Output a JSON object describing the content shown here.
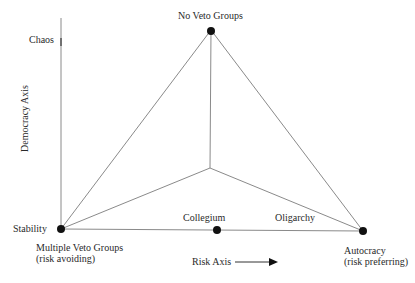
{
  "diagram": {
    "axes": {
      "vertical_label": "Democracy Axis",
      "horizontal_label": "Risk Axis",
      "vertical_top_label": "Chaos"
    },
    "nodes": [
      {
        "id": "top",
        "label": "No Veto Groups"
      },
      {
        "id": "left",
        "label": "Stability",
        "sublabel_1": "Multiple Veto Groups",
        "sublabel_2": "(risk avoiding)"
      },
      {
        "id": "right",
        "label": "Autocracy",
        "sublabel_1": "(risk preferring)"
      },
      {
        "id": "mid",
        "label": "Collegium"
      }
    ],
    "edge_labels": {
      "oligarchy": "Oligarchy"
    },
    "colors": {
      "line": "#8a8a8a",
      "node": "#111111",
      "text": "#2a2a2a"
    }
  }
}
